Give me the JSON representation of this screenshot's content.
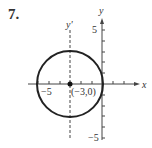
{
  "problem_number": "7.",
  "axes": {
    "x_label": "x",
    "y_label": "y",
    "translated_y_label": "y'",
    "x_tick_label": "−5",
    "y_tick_label_top": "5",
    "y_tick_label_bottom": "−5"
  },
  "center": {
    "label": "(−3,0)",
    "x": -3,
    "y": 0
  },
  "circle": {
    "center": [
      -3,
      0
    ],
    "radius": 3
  },
  "colors": {
    "stroke": "#222222",
    "text": "#333333"
  }
}
